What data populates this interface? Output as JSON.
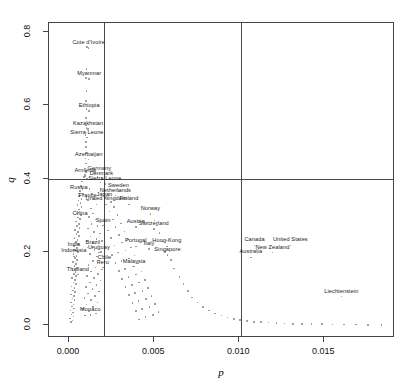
{
  "chart_data": {
    "type": "scatter",
    "title": "",
    "xlabel": "p",
    "ylabel": "q",
    "xlim": [
      -0.00118,
      0.01915
    ],
    "ylim": [
      -0.035,
      0.825
    ],
    "grid": false,
    "legend": null,
    "xticks": [
      "0.000",
      "0.005",
      "0.010",
      "0.015"
    ],
    "xtickvalues": [
      0.0,
      0.005,
      0.01,
      0.015
    ],
    "yticks": [
      "0.0",
      "0.2",
      "0.4",
      "0.6",
      "0.8"
    ],
    "ytickvalues": [
      0.0,
      0.2,
      0.4,
      0.6,
      0.8
    ],
    "reference_lines": [
      {
        "name": "vline-left",
        "orient": "vertical",
        "value": 0.00205
      },
      {
        "name": "vline-right",
        "orient": "vertical",
        "value": 0.0101
      },
      {
        "name": "hline-q",
        "orient": "horizontal",
        "value": 0.4
      }
    ],
    "labeled_points": [
      {
        "label": "Cote d'Ivoire",
        "x": 0.00115,
        "y": 0.757
      },
      {
        "label": "Myanmar",
        "x": 0.00118,
        "y": 0.672
      },
      {
        "label": "Ethiopia",
        "x": 0.00118,
        "y": 0.585
      },
      {
        "label": "Kazakhstan",
        "x": 0.00112,
        "y": 0.535
      },
      {
        "label": "Sierra Leone",
        "x": 0.00105,
        "y": 0.512
      },
      {
        "label": "Azerbaijan",
        "x": 0.00115,
        "y": 0.452
      },
      {
        "label": "Armenia",
        "x": 0.00095,
        "y": 0.406
      },
      {
        "label": "Germany",
        "x": 0.00178,
        "y": 0.414
      },
      {
        "label": "Denmark",
        "x": 0.0019,
        "y": 0.4
      },
      {
        "label": "Sierra Leone",
        "x": 0.0021,
        "y": 0.385
      },
      {
        "label": "Russia",
        "x": 0.00058,
        "y": 0.36
      },
      {
        "label": "Sweden",
        "x": 0.0029,
        "y": 0.366
      },
      {
        "label": "Netherlands",
        "x": 0.00272,
        "y": 0.354
      },
      {
        "label": "France",
        "x": 0.0011,
        "y": 0.34
      },
      {
        "label": "Japan",
        "x": 0.00208,
        "y": 0.343
      },
      {
        "label": "United Kingdom",
        "x": 0.00218,
        "y": 0.33
      },
      {
        "label": "Finland",
        "x": 0.00352,
        "y": 0.33
      },
      {
        "label": "Norway",
        "x": 0.00478,
        "y": 0.303
      },
      {
        "label": "China",
        "x": 0.00065,
        "y": 0.29
      },
      {
        "label": "Spain",
        "x": 0.002,
        "y": 0.272
      },
      {
        "label": "Austria",
        "x": 0.00392,
        "y": 0.268
      },
      {
        "label": "Switzerland",
        "x": 0.00498,
        "y": 0.262
      },
      {
        "label": "Portugal",
        "x": 0.00392,
        "y": 0.215
      },
      {
        "label": "Italy",
        "x": 0.0047,
        "y": 0.208
      },
      {
        "label": "Hong-Kong",
        "x": 0.00575,
        "y": 0.215
      },
      {
        "label": "Canada",
        "x": 0.0109,
        "y": 0.218
      },
      {
        "label": "United States",
        "x": 0.013,
        "y": 0.218
      },
      {
        "label": "India",
        "x": 0.00028,
        "y": 0.205
      },
      {
        "label": "Brazil",
        "x": 0.0014,
        "y": 0.212
      },
      {
        "label": "Uruguay",
        "x": 0.00175,
        "y": 0.198
      },
      {
        "label": "Singapore",
        "x": 0.00578,
        "y": 0.192
      },
      {
        "label": "New Zealand",
        "x": 0.01195,
        "y": 0.198
      },
      {
        "label": "Indonesia",
        "x": 0.00028,
        "y": 0.188
      },
      {
        "label": "Australia",
        "x": 0.01068,
        "y": 0.185
      },
      {
        "label": "Chile",
        "x": 0.00208,
        "y": 0.17
      },
      {
        "label": "Peru",
        "x": 0.00198,
        "y": 0.157
      },
      {
        "label": "Malaysia",
        "x": 0.00382,
        "y": 0.16
      },
      {
        "label": "Thailand",
        "x": 0.00052,
        "y": 0.138
      },
      {
        "label": "Liechtenstein",
        "x": 0.016,
        "y": 0.078
      },
      {
        "label": "Monaco",
        "x": 0.00125,
        "y": 0.028
      }
    ],
    "unlabeled_points": [
      [
        0.00104,
        0.76
      ],
      [
        0.00102,
        0.7
      ],
      [
        0.001,
        0.675
      ],
      [
        0.00102,
        0.64
      ],
      [
        0.00101,
        0.612
      ],
      [
        0.00103,
        0.59
      ],
      [
        0.001,
        0.566
      ],
      [
        0.00099,
        0.545
      ],
      [
        0.00102,
        0.538
      ],
      [
        0.00097,
        0.52
      ],
      [
        0.001,
        0.5
      ],
      [
        0.00098,
        0.486
      ],
      [
        0.00101,
        0.47
      ],
      [
        0.00096,
        0.455
      ],
      [
        0.00099,
        0.441
      ],
      [
        0.00094,
        0.428
      ],
      [
        0.001,
        0.418
      ],
      [
        0.00092,
        0.41
      ],
      [
        0.00086,
        0.404
      ],
      [
        0.00105,
        0.4
      ],
      [
        0.00155,
        0.417
      ],
      [
        0.00167,
        0.404
      ],
      [
        0.00185,
        0.39
      ],
      [
        0.00075,
        0.392
      ],
      [
        0.0007,
        0.38
      ],
      [
        0.00078,
        0.372
      ],
      [
        0.00064,
        0.366
      ],
      [
        0.00082,
        0.358
      ],
      [
        0.0006,
        0.352
      ],
      [
        0.00072,
        0.345
      ],
      [
        0.00055,
        0.34
      ],
      [
        0.00068,
        0.334
      ],
      [
        0.0005,
        0.328
      ],
      [
        0.00074,
        0.322
      ],
      [
        0.00058,
        0.316
      ],
      [
        0.00062,
        0.31
      ],
      [
        0.00045,
        0.305
      ],
      [
        0.0007,
        0.3
      ],
      [
        0.00052,
        0.294
      ],
      [
        0.00066,
        0.288
      ],
      [
        0.0004,
        0.283
      ],
      [
        0.00057,
        0.277
      ],
      [
        0.00048,
        0.271
      ],
      [
        0.00061,
        0.266
      ],
      [
        0.00036,
        0.26
      ],
      [
        0.00053,
        0.255
      ],
      [
        0.00044,
        0.249
      ],
      [
        0.00058,
        0.244
      ],
      [
        0.00033,
        0.238
      ],
      [
        0.00049,
        0.233
      ],
      [
        0.00041,
        0.227
      ],
      [
        0.00054,
        0.222
      ],
      [
        0.0003,
        0.216
      ],
      [
        0.00046,
        0.211
      ],
      [
        0.00038,
        0.205
      ],
      [
        0.00051,
        0.2
      ],
      [
        0.00027,
        0.194
      ],
      [
        0.00043,
        0.189
      ],
      [
        0.00035,
        0.183
      ],
      [
        0.00048,
        0.178
      ],
      [
        0.00024,
        0.172
      ],
      [
        0.0004,
        0.167
      ],
      [
        0.00032,
        0.161
      ],
      [
        0.00045,
        0.156
      ],
      [
        0.00021,
        0.15
      ],
      [
        0.00037,
        0.145
      ],
      [
        0.00029,
        0.139
      ],
      [
        0.00042,
        0.134
      ],
      [
        0.00018,
        0.128
      ],
      [
        0.00034,
        0.123
      ],
      [
        0.00026,
        0.117
      ],
      [
        0.00039,
        0.112
      ],
      [
        0.00015,
        0.106
      ],
      [
        0.00031,
        0.101
      ],
      [
        0.00023,
        0.095
      ],
      [
        0.00036,
        0.09
      ],
      [
        0.00013,
        0.084
      ],
      [
        0.00028,
        0.079
      ],
      [
        0.0002,
        0.073
      ],
      [
        0.00033,
        0.068
      ],
      [
        0.00011,
        0.062
      ],
      [
        0.00025,
        0.057
      ],
      [
        0.00017,
        0.051
      ],
      [
        0.0003,
        0.046
      ],
      [
        9e-05,
        0.04
      ],
      [
        0.00022,
        0.035
      ],
      [
        0.00014,
        0.029
      ],
      [
        0.00027,
        0.024
      ],
      [
        7e-05,
        0.018
      ],
      [
        0.00019,
        0.013
      ],
      [
        0.00012,
        0.008
      ],
      [
        0.0012,
        0.372
      ],
      [
        0.00135,
        0.358
      ],
      [
        0.00148,
        0.344
      ],
      [
        0.0016,
        0.33
      ],
      [
        0.00128,
        0.318
      ],
      [
        0.00142,
        0.305
      ],
      [
        0.00118,
        0.295
      ],
      [
        0.00156,
        0.288
      ],
      [
        0.00132,
        0.276
      ],
      [
        0.00168,
        0.27
      ],
      [
        0.00112,
        0.264
      ],
      [
        0.00145,
        0.255
      ],
      [
        0.0018,
        0.25
      ],
      [
        0.00125,
        0.242
      ],
      [
        0.0016,
        0.236
      ],
      [
        0.00195,
        0.23
      ],
      [
        0.00138,
        0.224
      ],
      [
        0.00172,
        0.218
      ],
      [
        0.00108,
        0.212
      ],
      [
        0.0015,
        0.206
      ],
      [
        0.00188,
        0.2
      ],
      [
        0.00122,
        0.194
      ],
      [
        0.00165,
        0.188
      ],
      [
        0.00202,
        0.182
      ],
      [
        0.0014,
        0.176
      ],
      [
        0.00178,
        0.17
      ],
      [
        0.00115,
        0.164
      ],
      [
        0.00155,
        0.158
      ],
      [
        0.00192,
        0.152
      ],
      [
        0.0013,
        0.146
      ],
      [
        0.0017,
        0.14
      ],
      [
        0.00105,
        0.134
      ],
      [
        0.00148,
        0.128
      ],
      [
        0.00185,
        0.122
      ],
      [
        0.00122,
        0.116
      ],
      [
        0.00162,
        0.11
      ],
      [
        0.00098,
        0.104
      ],
      [
        0.00138,
        0.098
      ],
      [
        0.00175,
        0.092
      ],
      [
        0.00112,
        0.086
      ],
      [
        0.00152,
        0.08
      ],
      [
        0.0009,
        0.074
      ],
      [
        0.00128,
        0.068
      ],
      [
        0.00166,
        0.062
      ],
      [
        0.00102,
        0.056
      ],
      [
        0.00142,
        0.05
      ],
      [
        0.00082,
        0.044
      ],
      [
        0.00118,
        0.038
      ],
      [
        0.00158,
        0.032
      ],
      [
        0.00095,
        0.026
      ],
      [
        0.00225,
        0.348
      ],
      [
        0.00245,
        0.336
      ],
      [
        0.00265,
        0.322
      ],
      [
        0.00238,
        0.31
      ],
      [
        0.00285,
        0.3
      ],
      [
        0.00258,
        0.288
      ],
      [
        0.00305,
        0.278
      ],
      [
        0.00272,
        0.268
      ],
      [
        0.00228,
        0.258
      ],
      [
        0.00325,
        0.256
      ],
      [
        0.00292,
        0.246
      ],
      [
        0.00248,
        0.238
      ],
      [
        0.00345,
        0.234
      ],
      [
        0.00312,
        0.226
      ],
      [
        0.00268,
        0.218
      ],
      [
        0.00232,
        0.212
      ],
      [
        0.00365,
        0.212
      ],
      [
        0.00332,
        0.204
      ],
      [
        0.00288,
        0.198
      ],
      [
        0.00252,
        0.192
      ],
      [
        0.00385,
        0.19
      ],
      [
        0.00352,
        0.182
      ],
      [
        0.00308,
        0.176
      ],
      [
        0.00272,
        0.17
      ],
      [
        0.00405,
        0.168
      ],
      [
        0.00372,
        0.16
      ],
      [
        0.00328,
        0.154
      ],
      [
        0.00292,
        0.148
      ],
      [
        0.00425,
        0.146
      ],
      [
        0.00392,
        0.138
      ],
      [
        0.00348,
        0.132
      ],
      [
        0.00312,
        0.126
      ],
      [
        0.00445,
        0.124
      ],
      [
        0.00412,
        0.116
      ],
      [
        0.00368,
        0.11
      ],
      [
        0.00332,
        0.104
      ],
      [
        0.00465,
        0.102
      ],
      [
        0.00432,
        0.094
      ],
      [
        0.00388,
        0.088
      ],
      [
        0.00352,
        0.082
      ],
      [
        0.00485,
        0.08
      ],
      [
        0.00452,
        0.072
      ],
      [
        0.00408,
        0.066
      ],
      [
        0.00372,
        0.06
      ],
      [
        0.00505,
        0.058
      ],
      [
        0.00472,
        0.05
      ],
      [
        0.00428,
        0.044
      ],
      [
        0.00392,
        0.038
      ],
      [
        0.00525,
        0.036
      ],
      [
        0.00492,
        0.028
      ],
      [
        0.00448,
        0.022
      ],
      [
        0.00412,
        0.016
      ],
      [
        0.00545,
        0.228
      ],
      [
        0.00562,
        0.2
      ],
      [
        0.00598,
        0.178
      ],
      [
        0.00615,
        0.155
      ],
      [
        0.00532,
        0.252
      ],
      [
        0.00518,
        0.272
      ],
      [
        0.00502,
        0.286
      ],
      [
        0.00648,
        0.132
      ],
      [
        0.00672,
        0.112
      ],
      [
        0.00698,
        0.094
      ],
      [
        0.00722,
        0.076
      ],
      [
        0.00755,
        0.062
      ],
      [
        0.00788,
        0.05
      ],
      [
        0.00822,
        0.04
      ],
      [
        0.00858,
        0.032
      ],
      [
        0.00895,
        0.026
      ],
      [
        0.00932,
        0.021
      ],
      [
        0.00968,
        0.017
      ],
      [
        0.01005,
        0.014
      ],
      [
        0.01045,
        0.011
      ],
      [
        0.01085,
        0.009
      ],
      [
        0.01128,
        0.008
      ],
      [
        0.01172,
        0.007
      ],
      [
        0.01218,
        0.006
      ],
      [
        0.01265,
        0.005
      ],
      [
        0.01315,
        0.004
      ],
      [
        0.01368,
        0.004
      ],
      [
        0.01425,
        0.003
      ],
      [
        0.01485,
        0.003
      ],
      [
        0.01548,
        0.002
      ],
      [
        0.01615,
        0.002
      ],
      [
        0.01685,
        0.002
      ],
      [
        0.01758,
        0.001
      ],
      [
        0.01835,
        0.001
      ]
    ]
  }
}
